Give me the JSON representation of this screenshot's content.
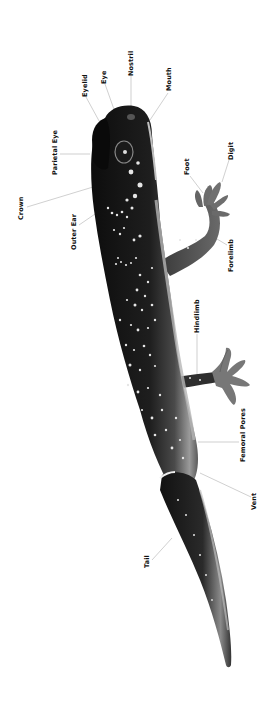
{
  "diagram": {
    "orientation": "rotated 90° counter-clockwise, head at top",
    "colors": {
      "background": "#ffffff",
      "body_dark": "#1a1a1a",
      "body_mid": "#555555",
      "belly_light": "#bdbdbd",
      "spots": "#e8e8e8",
      "leader_line": "#aaaaaa",
      "label_text": "#111111"
    },
    "labels": [
      {
        "id": "eyelid",
        "text": "Eyelid",
        "x": 85,
        "y": 97
      },
      {
        "id": "eye",
        "text": "Eye",
        "x": 103,
        "y": 84
      },
      {
        "id": "nostril",
        "text": "Nostril",
        "x": 127,
        "y": 76
      },
      {
        "id": "mouth",
        "text": "Mouth",
        "x": 166,
        "y": 91
      },
      {
        "id": "parietal-eye",
        "text": "Parietal Eye",
        "x": 51,
        "y": 175
      },
      {
        "id": "crown",
        "text": "Crown",
        "x": 17,
        "y": 220
      },
      {
        "id": "outer-ear",
        "text": "Outer Ear",
        "x": 70,
        "y": 250
      },
      {
        "id": "foot",
        "text": "Foot",
        "x": 186,
        "y": 175
      },
      {
        "id": "digit",
        "text": "Digit",
        "x": 227,
        "y": 160
      },
      {
        "id": "forelimb",
        "text": "Forelimb",
        "x": 227,
        "y": 272
      },
      {
        "id": "hindlimb",
        "text": "Hindlimb",
        "x": 193,
        "y": 333
      },
      {
        "id": "femoral-pores",
        "text": "Femoral Pores",
        "x": 239,
        "y": 462
      },
      {
        "id": "vent",
        "text": "Vent",
        "x": 251,
        "y": 510
      },
      {
        "id": "tail",
        "text": "Tail",
        "x": 143,
        "y": 568
      }
    ]
  }
}
